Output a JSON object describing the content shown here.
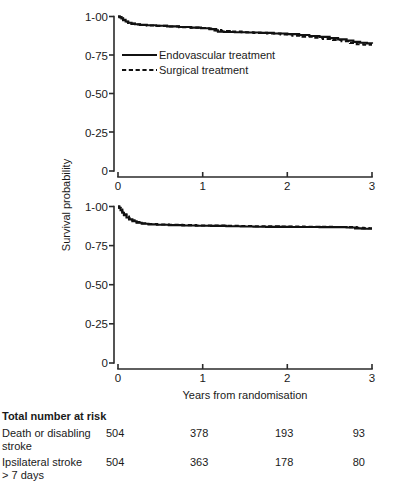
{
  "figure": {
    "x_axis_title": "Years from randomisation",
    "y_axis_title": "Survival probability"
  },
  "legend": {
    "entries": [
      {
        "label": "Endovascular treatment",
        "style": "solid"
      },
      {
        "label": "Surgical treatment",
        "style": "dashed"
      }
    ]
  },
  "risk_table": {
    "title": "Total number at risk",
    "rows": [
      {
        "label_line1": "Death or disabling",
        "label_line2": "stroke",
        "values": [
          "504",
          "378",
          "193",
          "93"
        ]
      },
      {
        "label_line1": "Ipsilateral stroke",
        "label_line2": "> 7 days",
        "values": [
          "504",
          "363",
          "178",
          "80"
        ]
      }
    ]
  },
  "chart_data": [
    {
      "type": "line",
      "panel": "top",
      "title": "",
      "xlabel": "Years from randomisation",
      "ylabel": "Survival probability",
      "xlim": [
        0,
        3
      ],
      "ylim": [
        0,
        1
      ],
      "xticks": [
        0,
        1,
        2,
        3
      ],
      "xtick_labels": [
        "0",
        "1",
        "2",
        "3"
      ],
      "yticks": [
        0,
        0.25,
        0.5,
        0.75,
        1.0
      ],
      "ytick_labels": [
        "0",
        "0-25",
        "0-50",
        "0-75",
        "1-00"
      ],
      "grid": false,
      "legend_position": "upper-left-inside",
      "series": [
        {
          "name": "Endovascular treatment",
          "style": "solid",
          "x": [
            0.0,
            0.02,
            0.04,
            0.06,
            0.09,
            0.12,
            0.16,
            0.2,
            0.26,
            0.34,
            0.45,
            0.58,
            0.72,
            0.86,
            0.98,
            1.08,
            1.14,
            1.18,
            1.25,
            1.38,
            1.52,
            1.68,
            1.84,
            2.0,
            2.14,
            2.26,
            2.38,
            2.5,
            2.6,
            2.7,
            2.78,
            2.86,
            2.94,
            3.0
          ],
          "y": [
            1.0,
            0.996,
            0.988,
            0.978,
            0.968,
            0.96,
            0.954,
            0.95,
            0.946,
            0.943,
            0.94,
            0.936,
            0.932,
            0.928,
            0.924,
            0.918,
            0.91,
            0.902,
            0.9,
            0.898,
            0.896,
            0.894,
            0.89,
            0.886,
            0.88,
            0.874,
            0.868,
            0.86,
            0.852,
            0.844,
            0.836,
            0.83,
            0.826,
            0.824
          ]
        },
        {
          "name": "Surgical treatment",
          "style": "dashed",
          "x": [
            0.0,
            0.02,
            0.04,
            0.06,
            0.09,
            0.12,
            0.16,
            0.2,
            0.26,
            0.34,
            0.45,
            0.58,
            0.72,
            0.86,
            0.98,
            1.06,
            1.12,
            1.16,
            1.22,
            1.32,
            1.46,
            1.6,
            1.76,
            1.92,
            2.06,
            2.18,
            2.3,
            2.42,
            2.54,
            2.64,
            2.74,
            2.82,
            2.9,
            3.0
          ],
          "y": [
            1.0,
            0.995,
            0.986,
            0.976,
            0.966,
            0.958,
            0.952,
            0.948,
            0.945,
            0.942,
            0.939,
            0.935,
            0.931,
            0.928,
            0.926,
            0.922,
            0.918,
            0.912,
            0.906,
            0.902,
            0.898,
            0.894,
            0.89,
            0.884,
            0.876,
            0.87,
            0.862,
            0.854,
            0.848,
            0.84,
            0.828,
            0.82,
            0.818,
            0.818
          ]
        }
      ]
    },
    {
      "type": "line",
      "panel": "bottom",
      "title": "",
      "xlabel": "Years from randomisation",
      "ylabel": "Survival probability",
      "xlim": [
        0,
        3
      ],
      "ylim": [
        0,
        1
      ],
      "xticks": [
        0,
        1,
        2,
        3
      ],
      "xtick_labels": [
        "0",
        "1",
        "2",
        "3"
      ],
      "yticks": [
        0,
        0.25,
        0.5,
        0.75,
        1.0
      ],
      "ytick_labels": [
        "0",
        "0-25",
        "0-50",
        "0-75",
        "1-00"
      ],
      "grid": false,
      "legend_position": "none",
      "series": [
        {
          "name": "Endovascular treatment",
          "style": "solid",
          "x": [
            0.0,
            0.015,
            0.03,
            0.05,
            0.07,
            0.1,
            0.13,
            0.17,
            0.22,
            0.28,
            0.36,
            0.46,
            0.6,
            0.76,
            0.92,
            1.1,
            1.28,
            1.45,
            1.6,
            1.75,
            1.9,
            2.05,
            2.2,
            2.38,
            2.55,
            2.7,
            2.8,
            2.88,
            2.94,
            3.0
          ],
          "y": [
            1.0,
            0.99,
            0.976,
            0.96,
            0.944,
            0.93,
            0.918,
            0.906,
            0.896,
            0.89,
            0.886,
            0.883,
            0.881,
            0.879,
            0.877,
            0.876,
            0.874,
            0.872,
            0.871,
            0.87,
            0.87,
            0.869,
            0.869,
            0.868,
            0.868,
            0.866,
            0.86,
            0.858,
            0.858,
            0.858
          ]
        },
        {
          "name": "Surgical treatment",
          "style": "dashed",
          "x": [
            0.0,
            0.015,
            0.03,
            0.05,
            0.07,
            0.1,
            0.13,
            0.17,
            0.22,
            0.28,
            0.36,
            0.46,
            0.6,
            0.76,
            0.92,
            1.1,
            1.28,
            1.45,
            1.6,
            1.75,
            1.9,
            2.05,
            2.2,
            2.38,
            2.55,
            2.7,
            2.82,
            2.9,
            2.96,
            3.0
          ],
          "y": [
            1.0,
            0.992,
            0.98,
            0.966,
            0.95,
            0.936,
            0.924,
            0.912,
            0.9,
            0.893,
            0.888,
            0.885,
            0.883,
            0.881,
            0.879,
            0.878,
            0.876,
            0.875,
            0.874,
            0.873,
            0.872,
            0.872,
            0.871,
            0.87,
            0.869,
            0.868,
            0.864,
            0.862,
            0.861,
            0.861
          ]
        }
      ]
    }
  ]
}
